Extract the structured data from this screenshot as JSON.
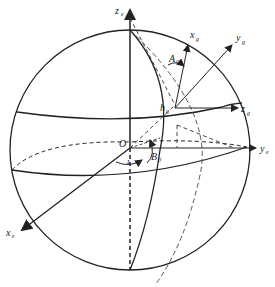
{
  "diagram": {
    "type": "coordinate-frames-on-sphere",
    "colors": {
      "stroke": "#222222",
      "background": "#ffffff"
    },
    "labels": {
      "ze": {
        "main": "z",
        "sub": "e"
      },
      "ye": {
        "main": "y",
        "sub": "e"
      },
      "xe": {
        "main": "x",
        "sub": "e"
      },
      "origin": {
        "main": "O"
      },
      "xg": {
        "main": "x",
        "sub": "g"
      },
      "yg": {
        "main": "y",
        "sub": "g"
      },
      "zg": {
        "main": "z",
        "sub": "g"
      },
      "azimuth": {
        "main": "A",
        "sub": "0"
      },
      "height": {
        "main": "h",
        "sub": "0"
      },
      "latitude": {
        "main": "B",
        "sub": "0"
      },
      "longitude": {
        "main": "L",
        "sub": "0"
      }
    }
  }
}
